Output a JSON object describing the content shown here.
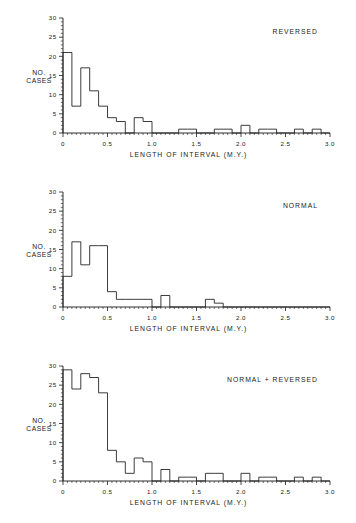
{
  "figure": {
    "background_color": "#ffffff",
    "line_color": "#1a1a1a"
  },
  "chart_data": [
    {
      "type": "bar",
      "title": "REVERSED",
      "xlabel": "LENGTH OF INTERVAL (M.Y.)",
      "ylabel": "NO. CASES",
      "ylabel_line1": "NO.",
      "ylabel_line2": "CASES",
      "xlim": [
        0,
        3.0
      ],
      "ylim": [
        0,
        30
      ],
      "bin_width": 0.1,
      "xticks": [
        0,
        0.5,
        1.0,
        1.5,
        2.0,
        2.5,
        3.0
      ],
      "xticklabels": [
        "0",
        "0.5",
        "1.0",
        "1.5",
        "2.0",
        "2.5",
        "3.0"
      ],
      "yticks": [
        0,
        5,
        10,
        15,
        20,
        25,
        30
      ],
      "yticklabels": [
        "0",
        "5",
        "10",
        "15",
        "20",
        "25",
        "30"
      ],
      "grid": false,
      "legend": "none",
      "bin_starts": [
        0.0,
        0.1,
        0.2,
        0.3,
        0.4,
        0.5,
        0.6,
        0.7,
        0.8,
        0.9,
        1.0,
        1.1,
        1.2,
        1.3,
        1.4,
        1.5,
        1.6,
        1.7,
        1.8,
        1.9,
        2.0,
        2.1,
        2.2,
        2.3,
        2.4,
        2.5,
        2.6,
        2.7,
        2.8,
        2.9
      ],
      "values": [
        21,
        7,
        17,
        11,
        7,
        4,
        3,
        0,
        4,
        3,
        0,
        0,
        0,
        1,
        1,
        0,
        0,
        1,
        1,
        0,
        2,
        0,
        1,
        1,
        0,
        0,
        1,
        0,
        1,
        0
      ]
    },
    {
      "type": "bar",
      "title": "NORMAL",
      "xlabel": "LENGTH OF INTERVAL (M.Y.)",
      "ylabel": "NO. CASES",
      "ylabel_line1": "NO.",
      "ylabel_line2": "CASES",
      "xlim": [
        0,
        3.0
      ],
      "ylim": [
        0,
        30
      ],
      "bin_width": 0.1,
      "xticks": [
        0,
        0.5,
        1.0,
        1.5,
        2.0,
        2.5,
        3.0
      ],
      "xticklabels": [
        "0",
        "0.5",
        "1.0",
        "1.5",
        "2.0",
        "2.5",
        "3.0"
      ],
      "yticks": [
        0,
        5,
        10,
        15,
        20,
        25,
        30
      ],
      "yticklabels": [
        "0",
        "5",
        "10",
        "15",
        "20",
        "25",
        "30"
      ],
      "grid": false,
      "legend": "none",
      "bin_starts": [
        0.0,
        0.1,
        0.2,
        0.3,
        0.4,
        0.5,
        0.6,
        0.7,
        0.8,
        0.9,
        1.0,
        1.1,
        1.2,
        1.3,
        1.4,
        1.5,
        1.6,
        1.7,
        1.8,
        1.9,
        2.0,
        2.1,
        2.2,
        2.3,
        2.4,
        2.5,
        2.6,
        2.7,
        2.8,
        2.9
      ],
      "values": [
        8,
        17,
        11,
        16,
        16,
        4,
        2,
        2,
        2,
        2,
        0,
        3,
        0,
        0,
        0,
        0,
        2,
        1,
        0,
        0,
        0,
        0,
        0,
        0,
        0,
        0,
        0,
        0,
        0,
        0
      ]
    },
    {
      "type": "bar",
      "title": "NORMAL + REVERSED",
      "xlabel": "LENGTH OF INTERVAL (M.Y.)",
      "ylabel": "NO. CASES",
      "ylabel_line1": "NO.",
      "ylabel_line2": "CASES",
      "xlim": [
        0,
        3.0
      ],
      "ylim": [
        0,
        30
      ],
      "bin_width": 0.1,
      "xticks": [
        0,
        0.5,
        1.0,
        1.5,
        2.0,
        2.5,
        3.0
      ],
      "xticklabels": [
        "0",
        "0.5",
        "1.0",
        "1.5",
        "2.0",
        "2.5",
        "3.0"
      ],
      "yticks": [
        0,
        5,
        10,
        15,
        20,
        25,
        30
      ],
      "yticklabels": [
        "0",
        "5",
        "10",
        "15",
        "20",
        "25",
        "30"
      ],
      "grid": false,
      "legend": "none",
      "bin_starts": [
        0.0,
        0.1,
        0.2,
        0.3,
        0.4,
        0.5,
        0.6,
        0.7,
        0.8,
        0.9,
        1.0,
        1.1,
        1.2,
        1.3,
        1.4,
        1.5,
        1.6,
        1.7,
        1.8,
        1.9,
        2.0,
        2.1,
        2.2,
        2.3,
        2.4,
        2.5,
        2.6,
        2.7,
        2.8,
        2.9
      ],
      "values": [
        29,
        24,
        28,
        27,
        23,
        8,
        5,
        2,
        6,
        5,
        0,
        3,
        0,
        1,
        1,
        0,
        2,
        2,
        0,
        0,
        2,
        0,
        1,
        1,
        0,
        0,
        1,
        0,
        1,
        0
      ]
    }
  ]
}
